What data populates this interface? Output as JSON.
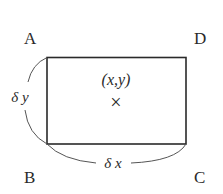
{
  "diagram": {
    "type": "rectangle-element",
    "corners": {
      "top_left": "A",
      "top_right": "D",
      "bottom_left": "B",
      "bottom_right": "C"
    },
    "center_label": "(x,y)",
    "center_marker": "×",
    "height_label": "δ y",
    "width_label": "δ x",
    "colors": {
      "stroke": "#2a2a2a",
      "arc": "#555555",
      "background": "#ffffff"
    }
  }
}
